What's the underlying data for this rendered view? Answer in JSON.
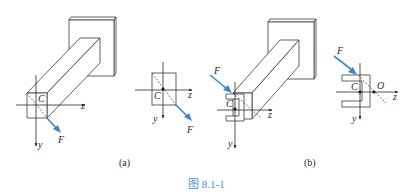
{
  "figure": {
    "caption": "图 8.1-1",
    "caption_color": "#4a90c8",
    "force_color": "#3f86c6"
  },
  "panel_a": {
    "label": "(a)",
    "iso": {
      "C": "C",
      "z": "z",
      "y": "y",
      "F": "F"
    },
    "section": {
      "C": "C",
      "z": "z",
      "y": "y",
      "F": "F"
    }
  },
  "panel_b": {
    "label": "(b)",
    "iso": {
      "C": "C",
      "z": "z",
      "y": "y",
      "F": "F"
    },
    "section": {
      "C": "C",
      "O": "O",
      "z": "z",
      "y": "y",
      "F": "F"
    }
  }
}
